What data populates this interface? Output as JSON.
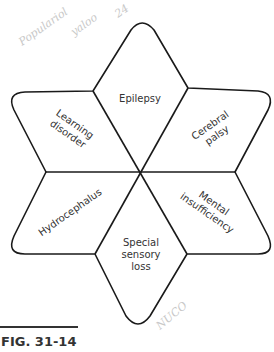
{
  "figure": {
    "caption": "FIG. 31-14",
    "center_label": "",
    "segments": [
      {
        "position": "top",
        "lines": [
          "Epilepsy"
        ]
      },
      {
        "position": "upper-right",
        "lines": [
          "Cerebral",
          "palsy"
        ]
      },
      {
        "position": "lower-right",
        "lines": [
          "Mental",
          "insufficiency"
        ]
      },
      {
        "position": "bottom",
        "lines": [
          "Special",
          "sensory",
          "loss"
        ]
      },
      {
        "position": "lower-left",
        "lines": [
          "Hydrocephalus"
        ]
      },
      {
        "position": "upper-left",
        "lines": [
          "Learning",
          "disorder"
        ]
      }
    ],
    "handwriting": {
      "top_line1": "Populariol",
      "top_line2": "yaloo",
      "top_line3": "24",
      "bottom": "NUCO"
    },
    "colors": {
      "stroke": "#1a1a1a",
      "text": "#333333",
      "handwriting": "#c8c8c8"
    }
  }
}
